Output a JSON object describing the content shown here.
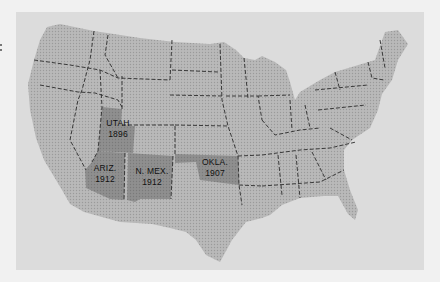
{
  "map": {
    "title": "",
    "colors": {
      "background": "#f1f1f1",
      "frame": "#dcdcdc",
      "land": "#b4b4b4",
      "highlight": "#8c8c8c",
      "border": "#333333"
    },
    "highlighted_states": [
      {
        "name": "UTAH",
        "year": "1896"
      },
      {
        "name": "ARIZ.",
        "year": "1912"
      },
      {
        "name": "N. MEX.",
        "year": "1912"
      },
      {
        "name": "OKLA.",
        "year": "1907"
      }
    ]
  }
}
